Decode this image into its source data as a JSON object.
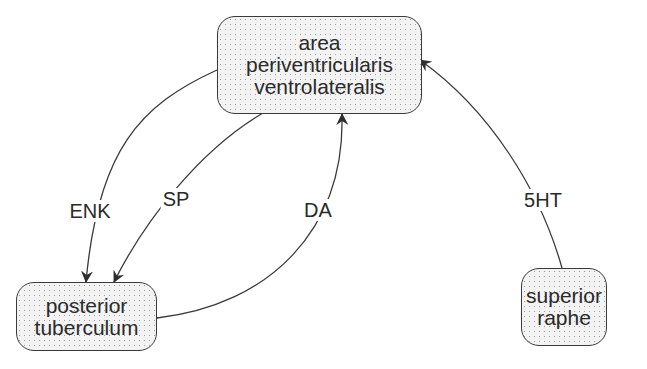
{
  "nodes": {
    "apvl": {
      "lines": [
        "area",
        "periventricularis",
        "ventrolateralis"
      ]
    },
    "pt": {
      "lines": [
        "posterior",
        "tuberculum"
      ]
    },
    "sr": {
      "lines": [
        "superior",
        "raphe"
      ]
    }
  },
  "edges": [
    {
      "label": "ENK",
      "from": "area periventricularis ventrolateralis",
      "to": "posterior tuberculum"
    },
    {
      "label": "SP",
      "from": "area periventricularis ventrolateralis",
      "to": "posterior tuberculum"
    },
    {
      "label": "DA",
      "from": "posterior tuberculum",
      "to": "area periventricularis ventrolateralis"
    },
    {
      "label": "5HT",
      "from": "superior raphe",
      "to": "area periventricularis ventrolateralis"
    }
  ],
  "colors": {
    "stroke": "#3a3a3a",
    "text": "#2a2a2a",
    "fill": "#f3f3f3"
  }
}
